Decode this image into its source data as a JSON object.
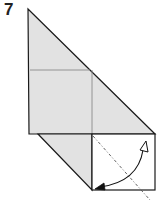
{
  "step": {
    "number": "7"
  },
  "diagram": {
    "colors": {
      "paper_colored": "#e2e2e2",
      "paper_white": "#ffffff",
      "outline": "#1a1a1a",
      "crease": "#8a8a8a",
      "dashed_fold_line": "#555555",
      "arrow": "#111111"
    },
    "elements": {
      "fold_line": "valley-fold-dashed-line",
      "arrow": "fold-arrow-curved"
    }
  }
}
